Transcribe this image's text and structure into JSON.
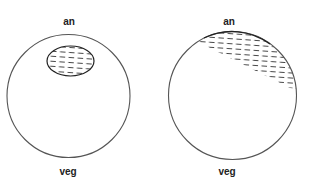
{
  "diagram": {
    "type": "embryo-pole-comparison",
    "colors": {
      "stroke": "#555555",
      "dash": "#333333",
      "background": "#ffffff"
    },
    "panels": [
      {
        "id": "left",
        "top_label": "an",
        "bottom_label": "veg",
        "shading": "oval patch near animal pole"
      },
      {
        "id": "right",
        "top_label": "an",
        "bottom_label": "veg",
        "shading": "oblique cap across animal hemisphere"
      }
    ]
  }
}
